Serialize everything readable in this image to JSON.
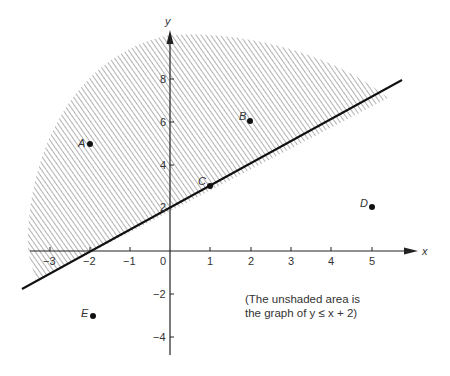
{
  "figure": {
    "type": "inequality-graph",
    "axes": {
      "x_label": "x",
      "y_label": "y",
      "x_ticks": [
        "−3",
        "−2",
        "−1",
        "0",
        "1",
        "2",
        "3",
        "4",
        "5"
      ],
      "y_ticks": [
        "8",
        "6",
        "4",
        "2",
        "−2",
        "−4"
      ]
    },
    "boundary_line": {
      "equation": "y = x + 2",
      "style": "solid"
    },
    "shaded_region": "y > x + 2",
    "points": [
      {
        "label": "A",
        "x": -2,
        "y": 5
      },
      {
        "label": "B",
        "x": 2,
        "y": 6
      },
      {
        "label": "C",
        "x": 1,
        "y": 3
      },
      {
        "label": "D",
        "x": 5,
        "y": 2
      },
      {
        "label": "E",
        "x": -2,
        "y": -3
      }
    ],
    "note_line1": "(The unshaded area is",
    "note_line2": "the graph of  y ≤ x + 2)"
  }
}
